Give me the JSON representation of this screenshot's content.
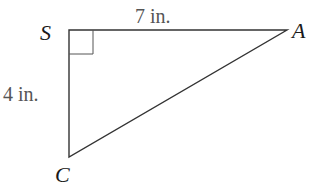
{
  "diagram": {
    "type": "right-triangle",
    "stroke_color": "#333333",
    "vertices": [
      {
        "label": "S",
        "x": 69,
        "y": 30
      },
      {
        "label": "A",
        "x": 287,
        "y": 30
      },
      {
        "label": "C",
        "x": 69,
        "y": 157
      }
    ],
    "right_angle_at": "S",
    "sides": {
      "SA": {
        "label": "7 in."
      },
      "SC": {
        "label": "4 in."
      }
    }
  }
}
